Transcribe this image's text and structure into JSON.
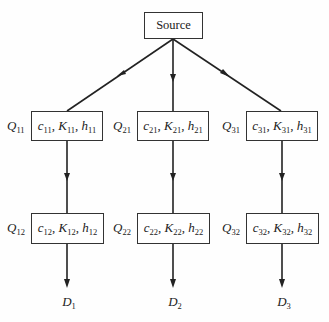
{
  "diagram": {
    "type": "supply-tree",
    "source": {
      "label": "Source"
    },
    "columns": [
      {
        "id": 1,
        "stage1": {
          "q": "Q",
          "q_sub": "11",
          "params": [
            {
              "sym": "c",
              "sub": "11"
            },
            {
              "sym": "K",
              "sub": "11"
            },
            {
              "sym": "h",
              "sub": "11"
            }
          ]
        },
        "stage2": {
          "q": "Q",
          "q_sub": "12",
          "params": [
            {
              "sym": "c",
              "sub": "12"
            },
            {
              "sym": "K",
              "sub": "12"
            },
            {
              "sym": "h",
              "sub": "12"
            }
          ]
        },
        "demand": {
          "d": "D",
          "d_sub": "1"
        }
      },
      {
        "id": 2,
        "stage1": {
          "q": "Q",
          "q_sub": "21",
          "params": [
            {
              "sym": "c",
              "sub": "21"
            },
            {
              "sym": "K",
              "sub": "21"
            },
            {
              "sym": "h",
              "sub": "21"
            }
          ]
        },
        "stage2": {
          "q": "Q",
          "q_sub": "22",
          "params": [
            {
              "sym": "c",
              "sub": "22"
            },
            {
              "sym": "K",
              "sub": "22"
            },
            {
              "sym": "h",
              "sub": "22"
            }
          ]
        },
        "demand": {
          "d": "D",
          "d_sub": "2"
        }
      },
      {
        "id": 3,
        "stage1": {
          "q": "Q",
          "q_sub": "31",
          "params": [
            {
              "sym": "c",
              "sub": "31"
            },
            {
              "sym": "K",
              "sub": "31"
            },
            {
              "sym": "h",
              "sub": "31"
            }
          ]
        },
        "stage2": {
          "q": "Q",
          "q_sub": "32",
          "params": [
            {
              "sym": "c",
              "sub": "32"
            },
            {
              "sym": "K",
              "sub": "32"
            },
            {
              "sym": "h",
              "sub": "32"
            }
          ]
        },
        "demand": {
          "d": "D",
          "d_sub": "3"
        }
      }
    ],
    "separator": ", "
  }
}
